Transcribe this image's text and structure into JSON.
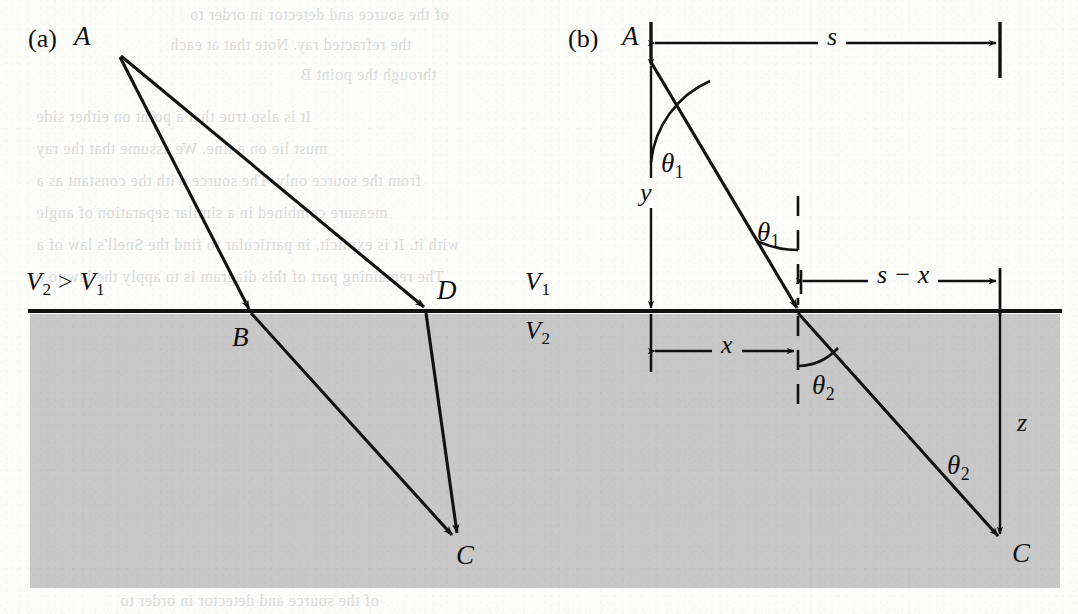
{
  "figure": {
    "kind": "refraction-ray-diagram",
    "caption_panels": [
      "(a)",
      "(b)"
    ],
    "background_color": "#fdfdfc",
    "medium_fill_color": "#c8c8c8",
    "ink_color": "#121212"
  },
  "panel_a": {
    "label": "(a)",
    "source_point": "A",
    "interface_points": [
      "B",
      "D"
    ],
    "target_point": "C",
    "velocity_relation": {
      "text": "V2 > V1",
      "v_symbol": "V",
      "sub_fast": "2",
      "comparator": ">",
      "sub_slow": "1"
    }
  },
  "panel_b": {
    "label": "(b)",
    "source_point": "A",
    "target_point": "C",
    "velocity_upper": {
      "symbol": "V",
      "subscript": "1"
    },
    "velocity_lower": {
      "symbol": "V",
      "subscript": "2"
    },
    "angles": [
      {
        "name": "theta1-at-source",
        "glyph": "θ",
        "subscript": "1"
      },
      {
        "name": "theta1-at-interface",
        "glyph": "θ",
        "subscript": "1"
      },
      {
        "name": "theta2-at-interface",
        "glyph": "θ",
        "subscript": "2"
      },
      {
        "name": "theta2-along-ray",
        "glyph": "θ",
        "subscript": "2"
      }
    ],
    "dimensions": [
      {
        "name": "s",
        "text": "s",
        "orientation": "horizontal",
        "position": "top"
      },
      {
        "name": "y",
        "text": "y",
        "orientation": "vertical",
        "position": "left"
      },
      {
        "name": "x",
        "text": "x",
        "orientation": "horizontal",
        "position": "below-interface"
      },
      {
        "name": "s-minus-x",
        "text": "s − x",
        "orientation": "horizontal",
        "position": "above-interface"
      },
      {
        "name": "z",
        "text": "z",
        "orientation": "vertical",
        "position": "right"
      }
    ]
  },
  "bleed_text": {
    "lines": [
      "of the source and detector in order to",
      "the refracted ray. Note that at each",
      "through the point B",
      "It is also true that a point on either side",
      "must lie on a line. We assume that the ray",
      "from the source only. The source with the constant as a",
      "measure combined in a similar separation of angle",
      "with it. It is explicit, in particular to find the Snell's law of a",
      "The remaining part of this diagram is to apply the law to a",
      "solid and reduction of the surface. From the refracted ray at the",
      "Snell law is equivalent to Snell's law. For example, the angle of wave",
      "the wave, which will permit a light or ray through the wave under"
    ]
  }
}
